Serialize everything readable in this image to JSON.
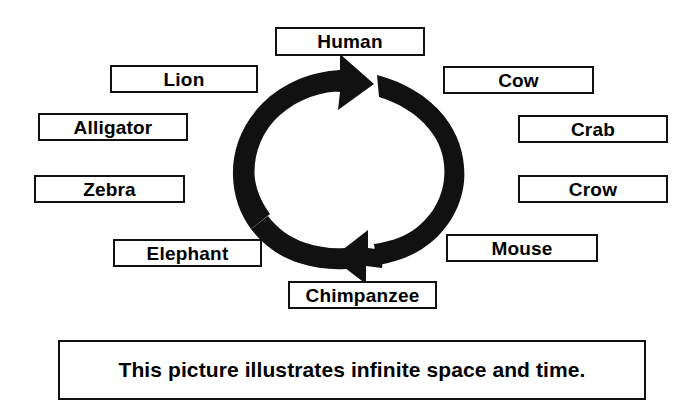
{
  "diagram": {
    "caption": "This picture illustrates infinite space and time.",
    "colors": {
      "arrow": "#111111",
      "box_border": "#111111",
      "text": "#000000",
      "background": "#ffffff"
    },
    "cycle_arrow": {
      "name": "circular-cycle-arrow",
      "direction": "clockwise",
      "arrowheads": 2,
      "arrowhead_positions": [
        "top",
        "bottom"
      ]
    },
    "labels": [
      {
        "id": "human",
        "text": "Human"
      },
      {
        "id": "cow",
        "text": "Cow"
      },
      {
        "id": "crab",
        "text": "Crab"
      },
      {
        "id": "crow",
        "text": "Crow"
      },
      {
        "id": "mouse",
        "text": "Mouse"
      },
      {
        "id": "chimpanzee",
        "text": "Chimpanzee"
      },
      {
        "id": "elephant",
        "text": "Elephant"
      },
      {
        "id": "zebra",
        "text": "Zebra"
      },
      {
        "id": "alligator",
        "text": "Alligator"
      },
      {
        "id": "lion",
        "text": "Lion"
      }
    ]
  }
}
